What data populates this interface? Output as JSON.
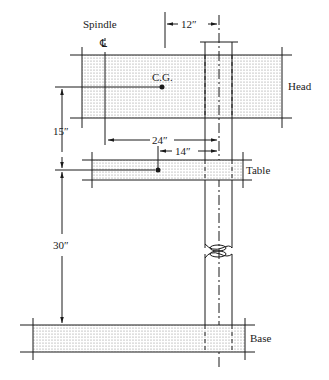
{
  "diagram": {
    "type": "machine-tool-schematic",
    "labels": {
      "spindle": "Spindle",
      "centerline": "℄",
      "head_cg": "C.G.",
      "head": "Head",
      "table": "Table",
      "base": "Base"
    },
    "dimensions": {
      "head_cg_to_column": "12″",
      "head_to_table_vertical": "15″",
      "spindle_to_column": "24″",
      "table_cg_to_column": "14″",
      "table_to_base_vertical": "30″"
    },
    "colors": {
      "line": "#1a1a1a",
      "fill_dots": "#9a9a9a",
      "background": "#ffffff"
    }
  }
}
